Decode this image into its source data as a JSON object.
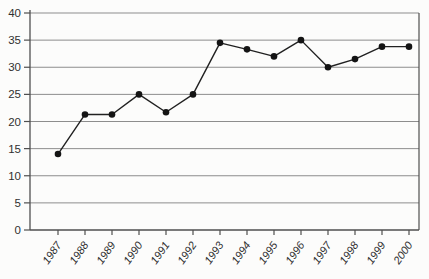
{
  "chart": {
    "background": "#fcfcfb",
    "colors": {
      "line": "#212121",
      "marker": "#141414",
      "grid": "#8d8d8d",
      "frame": "#4f4f4f",
      "tick": "#4f4f4f",
      "label": "#303030"
    }
  },
  "chart_data": {
    "type": "line",
    "title": "",
    "xlabel": "",
    "ylabel": "",
    "categories": [
      "1987",
      "1988",
      "1989",
      "1990",
      "1991",
      "1992",
      "1993",
      "1994",
      "1995",
      "1996",
      "1997",
      "1998",
      "1999",
      "2000"
    ],
    "series": [
      {
        "name": "series-1",
        "values": [
          14,
          21.3,
          21.3,
          25,
          21.7,
          25,
          34.5,
          33.3,
          32,
          35,
          30,
          31.5,
          33.8,
          33.8
        ]
      }
    ],
    "ylim": [
      0,
      40
    ],
    "yticks": [
      0,
      5,
      10,
      15,
      20,
      25,
      30,
      35,
      40
    ],
    "grid": true,
    "legend_position": "none",
    "marker": "filled-circle",
    "x_tick_label_rotation_deg": -55
  }
}
